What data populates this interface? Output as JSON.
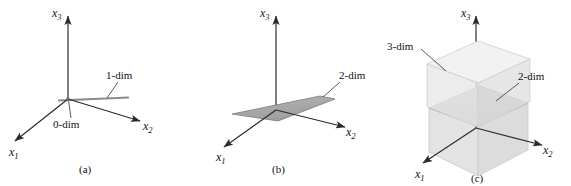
{
  "figure": {
    "panels": [
      {
        "id": "a",
        "caption": "(a)",
        "axes": [
          {
            "name": "x1",
            "base": "x",
            "sub": "1"
          },
          {
            "name": "x2",
            "base": "x",
            "sub": "2"
          },
          {
            "name": "x3",
            "base": "x",
            "sub": "3"
          }
        ],
        "annotations": [
          {
            "name": "zero-dim",
            "label": "0-dim"
          },
          {
            "name": "one-dim",
            "label": "1-dim"
          }
        ]
      },
      {
        "id": "b",
        "caption": "(b)",
        "axes": [
          {
            "name": "x1",
            "base": "x",
            "sub": "1"
          },
          {
            "name": "x2",
            "base": "x",
            "sub": "2"
          },
          {
            "name": "x3",
            "base": "x",
            "sub": "3"
          }
        ],
        "annotations": [
          {
            "name": "two-dim",
            "label": "2-dim"
          }
        ]
      },
      {
        "id": "c",
        "caption": "(c)",
        "axes": [
          {
            "name": "x1",
            "base": "x",
            "sub": "1"
          },
          {
            "name": "x2",
            "base": "x",
            "sub": "2"
          },
          {
            "name": "x3",
            "base": "x",
            "sub": "3"
          }
        ],
        "annotations": [
          {
            "name": "three-dim",
            "label": "3-dim"
          },
          {
            "name": "two-dim",
            "label": "2-dim"
          }
        ]
      }
    ],
    "colors": {
      "axis": "#2b2b2b",
      "leader": "#4a4a4a",
      "plane_fill": "#a9a9a9",
      "plane_edge": "#6e6e6e",
      "line_1d": "#8a8a8a",
      "cube_fill": "#e2e2e2",
      "cube_top": "#efefef",
      "cube_edge": "#c6c6c6",
      "background": "#ffffff"
    }
  }
}
